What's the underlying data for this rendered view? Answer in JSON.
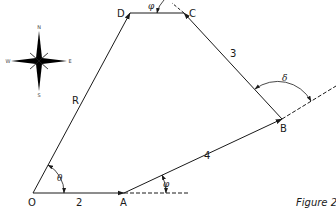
{
  "figure": {
    "caption": "Figure 2",
    "line_color": "#1a1a1a"
  },
  "compass": {
    "north": "N",
    "south": "S",
    "east": "E",
    "west": "W"
  },
  "points": {
    "O": "O",
    "A": "A",
    "B": "B",
    "C": "C",
    "D": "D"
  },
  "segments": {
    "OA": "2",
    "AB": "4",
    "BC": "3",
    "OD": "R"
  },
  "angles": {
    "theta": "θ",
    "phi_A": "φ",
    "delta": "δ",
    "phi_C": "φ"
  }
}
